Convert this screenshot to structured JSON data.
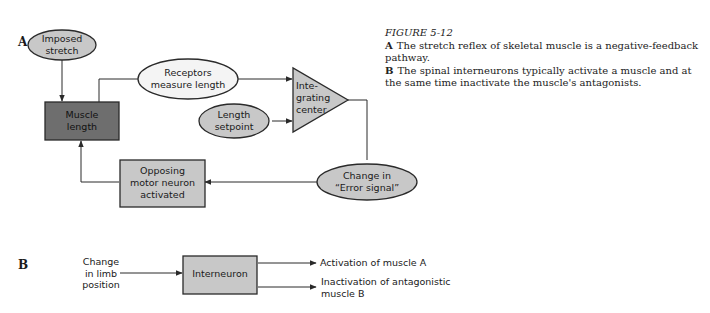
{
  "caption": {
    "title": "FIGURE 5-12",
    "a_letter": "A",
    "a_text": "The stretch reflex of skeletal muscle is a negative-feedback pathway.",
    "b_letter": "B",
    "b_text": "The spinal interneurons typically activate a muscle and at the same time inactivate the muscle's antagonists."
  },
  "panel_a": {
    "letter": "A",
    "nodes": {
      "imposed_stretch": {
        "line1": "Imposed",
        "line2": "stretch"
      },
      "muscle_length": {
        "line1": "Muscle",
        "line2": "length"
      },
      "receptors": {
        "line1": "Receptors",
        "line2": "measure length"
      },
      "length_setpoint": {
        "line1": "Length",
        "line2": "setpoint"
      },
      "integrating_center": {
        "line1": "Inte-",
        "line2": "grating",
        "line3": "center"
      },
      "error_signal": {
        "line1": "Change in",
        "line2": "“Error signal”"
      },
      "opposing_motor": {
        "line1": "Opposing",
        "line2": "motor neuron",
        "line3": "activated"
      }
    }
  },
  "panel_b": {
    "letter": "B",
    "input": {
      "line1": "Change",
      "line2": "in limb",
      "line3": "position"
    },
    "interneuron": "Interneuron",
    "output1": "Activation of muscle A",
    "output2_line1": "Inactivation of antagonistic",
    "output2_line2": "muscle B"
  },
  "colors": {
    "light_fill": "#c8c8c8",
    "dark_fill": "#6e6e6e",
    "white_fill": "#f4f4f4",
    "stroke": "#2a2a2a"
  }
}
